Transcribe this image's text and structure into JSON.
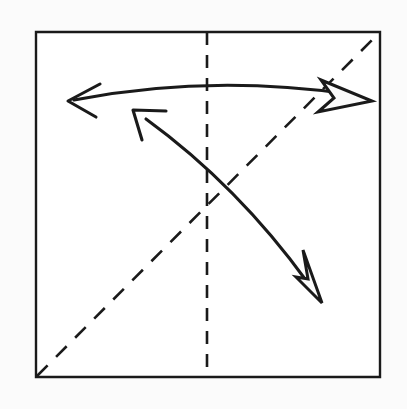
{
  "diagram": {
    "type": "origami-fold-instruction",
    "background_color": "#fbfbfb",
    "ink_color": "#1a1a1a",
    "paper_fill": "#ffffff",
    "canvas": {
      "width": 407,
      "height": 409
    }
  },
  "paper": {
    "label": "square sheet",
    "shape": "square",
    "corners": {
      "top_left": [
        36,
        32
      ],
      "top_right": [
        380,
        32
      ],
      "bottom_right": [
        380,
        377
      ],
      "bottom_left": [
        36,
        377
      ]
    },
    "stroke_width": 2.4,
    "outline_points": "36,32 380,32 380,377 36,377"
  },
  "creases": [
    {
      "name": "vertical-center-crease",
      "label": "vertical center fold line",
      "style": "dashed",
      "from": [
        207,
        32
      ],
      "to": [
        207,
        377
      ],
      "dash_pattern": "13 10",
      "stroke_width": 2.6
    },
    {
      "name": "diagonal-crease",
      "label": "diagonal fold line, bottom-left to top-right",
      "style": "dashed",
      "from": [
        37,
        376
      ],
      "to": [
        379,
        33
      ],
      "dash_pattern": "15 12",
      "stroke_width": 2.6
    }
  ],
  "arrows": [
    {
      "name": "top-arc-arrow",
      "label": "horizontal fold-and-unfold arc across the top",
      "shaft_path": "M 74 100 Q 208 74 348 94",
      "start_point": [
        74,
        100
      ],
      "end_point": [
        348,
        94
      ],
      "head_start": {
        "type": "open-v",
        "tip": [
          68,
          101
        ],
        "barbs": "M 100 84 L 68 101 L 96 117"
      },
      "head_end": {
        "type": "hollow-triangle",
        "tip": [
          372,
          101
        ],
        "polygon": "321,80 372,101 318,112 334,98"
      }
    },
    {
      "name": "diagonal-arc-arrow",
      "label": "diagonal fold-and-unfold arc from upper-left to lower-right",
      "shaft_path": "M 146 119 Q 238 186 308 283",
      "start_point": [
        146,
        119
      ],
      "end_point": [
        308,
        283
      ],
      "head_start": {
        "type": "open-v",
        "tip": [
          133,
          110
        ],
        "barbs": "M 166 111 L 133 110 L 142 140"
      },
      "head_end": {
        "type": "hollow-triangle",
        "tip": [
          322,
          303
        ],
        "polygon": "296,277 322,303 303,250 308,279"
      }
    }
  ]
}
